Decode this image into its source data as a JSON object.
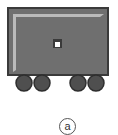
{
  "figure": {
    "label": "a",
    "colors": {
      "body_fill": "#6f6f6f",
      "body_border": "#3a3a3a",
      "highlight": "#c8c8c8",
      "wheel_fill": "#4f4f4f",
      "wheel_border": "#2e2e2e",
      "window_fill": "#ffffff"
    },
    "parts": [
      "cart-body",
      "window",
      "wheel",
      "wheel",
      "wheel",
      "wheel"
    ]
  }
}
